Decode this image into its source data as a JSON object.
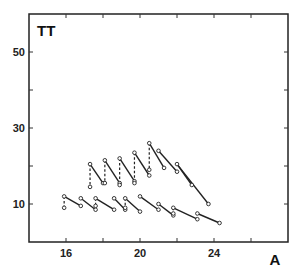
{
  "chart_data": {
    "type": "line",
    "title": "",
    "panel_label": "TT",
    "xlabel": "A",
    "ylabel": "",
    "xlim": [
      13.5,
      27.5
    ],
    "ylim": [
      2,
      62
    ],
    "x_ticks": [
      16,
      20,
      24
    ],
    "x_minor_ticks": [
      18,
      22,
      26
    ],
    "y_ticks": [
      10,
      30,
      50
    ],
    "y_minor_ticks": [
      20,
      40
    ],
    "grid": false,
    "legend": null,
    "series": [
      {
        "name": "upper (solid segments)",
        "segments": [
          [
            [
              17.3,
              20.5
            ],
            [
              18.0,
              15.5
            ]
          ],
          [
            [
              18.1,
              21.5
            ],
            [
              18.9,
              15.5
            ]
          ],
          [
            [
              18.9,
              22.0
            ],
            [
              19.7,
              16.0
            ]
          ],
          [
            [
              19.7,
              23.5
            ],
            [
              20.5,
              17.5
            ]
          ],
          [
            [
              20.5,
              26.0
            ],
            [
              21.3,
              19.5
            ]
          ],
          [
            [
              21.0,
              24.0
            ],
            [
              22.0,
              18.5
            ]
          ],
          [
            [
              22.0,
              20.5
            ],
            [
              22.8,
              15.0
            ]
          ],
          [
            [
              22.0,
              20.5
            ],
            [
              23.7,
              10.0
            ]
          ]
        ]
      },
      {
        "name": "upper (dashed verticals)",
        "segments": [
          [
            [
              17.3,
              20.5
            ],
            [
              17.3,
              14.5
            ]
          ],
          [
            [
              18.1,
              21.5
            ],
            [
              18.1,
              15.5
            ]
          ],
          [
            [
              18.9,
              22.0
            ],
            [
              18.9,
              15.0
            ]
          ],
          [
            [
              19.7,
              23.5
            ],
            [
              19.7,
              15.5
            ]
          ],
          [
            [
              20.5,
              26.0
            ],
            [
              20.5,
              19.0
            ]
          ]
        ]
      },
      {
        "name": "lower (solid segments)",
        "segments": [
          [
            [
              15.9,
              12.0
            ],
            [
              16.8,
              9.5
            ]
          ],
          [
            [
              16.8,
              11.5
            ],
            [
              17.6,
              8.5
            ]
          ],
          [
            [
              17.6,
              11.5
            ],
            [
              18.6,
              8.5
            ]
          ],
          [
            [
              18.6,
              11.5
            ],
            [
              19.2,
              8.5
            ]
          ],
          [
            [
              19.2,
              11.5
            ],
            [
              20.0,
              8.0
            ]
          ],
          [
            [
              20.0,
              12.0
            ],
            [
              21.0,
              8.5
            ]
          ],
          [
            [
              21.0,
              10.0
            ],
            [
              21.8,
              7.0
            ]
          ],
          [
            [
              21.8,
              9.0
            ],
            [
              23.1,
              6.0
            ]
          ],
          [
            [
              23.1,
              7.5
            ],
            [
              24.3,
              5.0
            ]
          ]
        ]
      },
      {
        "name": "lower (dashed verticals)",
        "segments": [
          [
            [
              15.9,
              12.0
            ],
            [
              15.9,
              9.0
            ]
          ],
          [
            [
              17.6,
              11.5
            ],
            [
              17.6,
              9.5
            ]
          ],
          [
            [
              19.2,
              11.5
            ],
            [
              19.2,
              9.0
            ]
          ],
          [
            [
              21.8,
              9.0
            ],
            [
              21.8,
              7.5
            ]
          ]
        ]
      }
    ]
  }
}
